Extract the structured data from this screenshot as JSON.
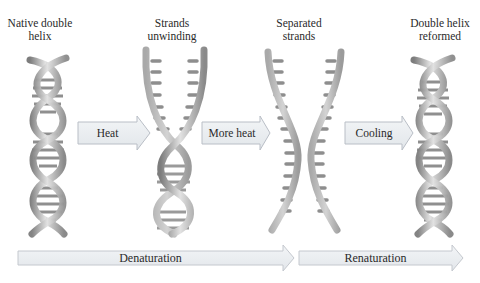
{
  "stages": [
    {
      "id": "native",
      "line1": "Native double",
      "line2": "helix"
    },
    {
      "id": "unwinding",
      "line1": "Strands",
      "line2": "unwinding"
    },
    {
      "id": "separated",
      "line1": "Separated",
      "line2": "strands"
    },
    {
      "id": "reformed",
      "line1": "Double helix",
      "line2": "reformed"
    }
  ],
  "transitions": [
    {
      "id": "heat",
      "label": "Heat"
    },
    {
      "id": "more-heat",
      "label": "More heat"
    },
    {
      "id": "cooling",
      "label": "Cooling"
    }
  ],
  "processes": [
    {
      "id": "denaturation",
      "label": "Denaturation"
    },
    {
      "id": "renaturation",
      "label": "Renaturation"
    }
  ],
  "colors": {
    "arrow_fill": "#e9ecf0",
    "arrow_stroke": "#b9bec6",
    "strand_fill": "#c9c9c9",
    "strand_dark": "#8e8e8e",
    "base_pair": "#9a9a9a"
  }
}
